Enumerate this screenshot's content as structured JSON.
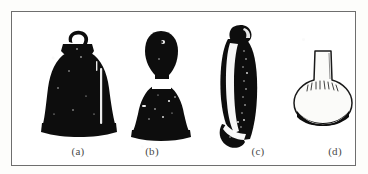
{
  "figure": {
    "kind": "photographic-plate",
    "background_color": "#ffffff",
    "frame_color": "#6e6e6e",
    "ink_color": "#0d0d0d",
    "caption_color": "#4a4a4a",
    "panel_count": 4
  },
  "panels": [
    {
      "id": "a",
      "label": "(a)",
      "icon": "bell-with-loop-handle-icon",
      "description": "dark silhouette bell with small ring handle, flared skirt and vertical highlight"
    },
    {
      "id": "b",
      "label": "(b)",
      "icon": "bell-with-bulbous-handle-icon",
      "description": "dark silhouette bell with ovoid knob handle separated by light collar"
    },
    {
      "id": "c",
      "label": "(c)",
      "icon": "elongated-bell-profile-icon",
      "description": "tall narrow tilted dark form with light interior band and light diagonal band at base"
    },
    {
      "id": "d",
      "label": "(d)",
      "icon": "narrow-neck-flask-icon",
      "description": "light outlined squat flask with cylindrical neck and dark shaded base"
    }
  ]
}
